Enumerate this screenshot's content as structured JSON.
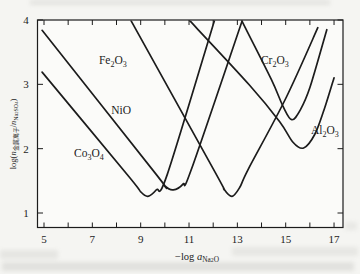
{
  "figure": {
    "background": "#f5f5f2",
    "ink": "#1c1c1c"
  },
  "chart_data": {
    "type": "line",
    "title": "",
    "xlabel": "-log a_Na2O",
    "xlabel_segments": [
      {
        "t": "−log "
      },
      {
        "t": "a",
        "i": 1
      },
      {
        "t": "Na",
        "s": 1
      },
      {
        "t": "2",
        "s": 2
      },
      {
        "t": "O",
        "s": 1
      }
    ],
    "ylabel": "log(n_metal-ion / n_Na2SO4)",
    "ylabel_segments": [
      {
        "t": "log("
      },
      {
        "t": "n",
        "i": 1
      },
      {
        "t": "金属离子",
        "s": 1
      },
      {
        "t": "/"
      },
      {
        "t": "n",
        "i": 1
      },
      {
        "t": "Na",
        "s": 1
      },
      {
        "t": "2",
        "s": 2
      },
      {
        "t": "SO",
        "s": 1
      },
      {
        "t": "4",
        "s": 2
      },
      {
        "t": ")"
      }
    ],
    "x_axis": {
      "min": 4.73,
      "max": 17.37,
      "grid": false,
      "ticks": [
        {
          "v": 5,
          "label": "5"
        },
        {
          "v": 6,
          "label": ""
        },
        {
          "v": 7,
          "label": "7"
        },
        {
          "v": 8,
          "label": ""
        },
        {
          "v": 9,
          "label": "9"
        },
        {
          "v": 10,
          "label": ""
        },
        {
          "v": 11,
          "label": "11"
        },
        {
          "v": 12,
          "label": ""
        },
        {
          "v": 13,
          "label": "13"
        },
        {
          "v": 14,
          "label": ""
        },
        {
          "v": 15,
          "label": "15"
        },
        {
          "v": 16,
          "label": ""
        },
        {
          "v": 17,
          "label": "17"
        }
      ]
    },
    "y_axis": {
      "min": 0.77,
      "max": 4.0,
      "grid": false,
      "ticks": [
        {
          "v": 1,
          "label": "1"
        },
        {
          "v": 2,
          "label": "2"
        },
        {
          "v": 3,
          "label": "3"
        },
        {
          "v": 4,
          "label": "4"
        }
      ]
    },
    "series": [
      {
        "name": "Co3O4",
        "label_segments": [
          {
            "t": "Co"
          },
          {
            "t": "3",
            "s": 1
          },
          {
            "t": "O"
          },
          {
            "t": "4",
            "s": 1
          }
        ],
        "label_pos": [
          6.86,
          1.92
        ],
        "minimum": {
          "x": 9.3,
          "y": 1.26
        },
        "points": [
          [
            4.92,
            3.19
          ],
          [
            8.5,
            1.57
          ],
          [
            9.0,
            1.33
          ],
          [
            9.3,
            1.26
          ],
          [
            9.65,
            1.36
          ],
          [
            10.1,
            1.6
          ],
          [
            12.05,
            3.99
          ]
        ]
      },
      {
        "name": "NiO",
        "label_segments": [
          {
            "t": "NiO"
          }
        ],
        "label_pos": [
          8.19,
          2.59
        ],
        "minimum": {
          "x": 10.35,
          "y": 1.36
        },
        "points": [
          [
            4.92,
            3.84
          ],
          [
            9.6,
            1.62
          ],
          [
            10.0,
            1.42
          ],
          [
            10.35,
            1.36
          ],
          [
            10.75,
            1.45
          ],
          [
            11.1,
            1.68
          ],
          [
            13.2,
            3.99
          ]
        ]
      },
      {
        "name": "Fe2O3",
        "label_segments": [
          {
            "t": "Fe"
          },
          {
            "t": "2",
            "s": 1
          },
          {
            "t": "O"
          },
          {
            "t": "3",
            "s": 1
          }
        ],
        "label_pos": [
          7.85,
          3.36
        ],
        "minimum": {
          "x": 12.78,
          "y": 1.26
        },
        "points": [
          [
            8.6,
            3.99
          ],
          [
            12.1,
            1.62
          ],
          [
            12.45,
            1.37
          ],
          [
            12.78,
            1.26
          ],
          [
            13.1,
            1.4
          ],
          [
            13.45,
            1.68
          ],
          [
            15.0,
            2.78
          ],
          [
            16.33,
            3.88
          ]
        ]
      },
      {
        "name": "Cr2O3",
        "label_segments": [
          {
            "t": "Cr"
          },
          {
            "t": "2",
            "s": 1
          },
          {
            "t": "O"
          },
          {
            "t": "3",
            "s": 1
          }
        ],
        "label_pos": [
          14.55,
          3.36
        ],
        "minimum": {
          "x": 15.25,
          "y": 2.45
        },
        "points": [
          [
            13.18,
            3.99
          ],
          [
            14.4,
            3.08
          ],
          [
            14.9,
            2.65
          ],
          [
            15.25,
            2.45
          ],
          [
            15.6,
            2.6
          ],
          [
            16.0,
            2.95
          ],
          [
            16.7,
            3.85
          ]
        ]
      },
      {
        "name": "Al2O3",
        "label_segments": [
          {
            "t": "Al"
          },
          {
            "t": "2",
            "s": 1
          },
          {
            "t": "O"
          },
          {
            "t": "3",
            "s": 1
          }
        ],
        "label_pos": [
          16.62,
          2.28
        ],
        "minimum": {
          "x": 15.74,
          "y": 2.01
        },
        "points": [
          [
            11.03,
            3.99
          ],
          [
            13.5,
            2.99
          ],
          [
            14.75,
            2.42
          ],
          [
            15.3,
            2.1
          ],
          [
            15.74,
            2.01
          ],
          [
            16.2,
            2.22
          ],
          [
            16.6,
            2.62
          ],
          [
            17.0,
            3.1
          ]
        ]
      }
    ]
  }
}
